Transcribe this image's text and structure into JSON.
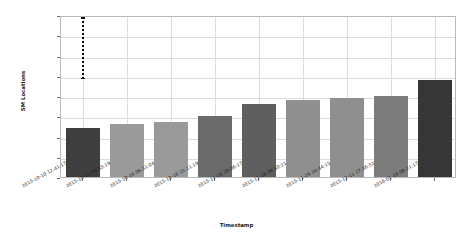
{
  "chart_data": {
    "type": "bar",
    "title": "",
    "xlabel": "Timestamp",
    "ylabel": "SM Locations",
    "ylim": [
      0,
      40
    ],
    "ytick_labels": [
      "0",
      "5",
      "10",
      "15",
      "20",
      "25",
      "30",
      "35",
      "40"
    ],
    "ytick_values": [
      0,
      5,
      10,
      15,
      20,
      25,
      30,
      35,
      40
    ],
    "grid": true,
    "legend": "none",
    "categories": [
      "2015-10-10 12:41:17",
      "2015-10-11 09:35:19",
      "2015-10-18 06:31:04",
      "2015-10-18 15:11:19",
      "2015-11-16 18:06:17",
      "2015-11-28 08:50:21",
      "2015-11-29 14:44:15",
      "2015-12-11 17:36:32",
      "2016-01-18 08:21:17"
    ],
    "values": [
      12,
      13,
      13.5,
      15,
      18,
      19,
      19.5,
      20,
      24
    ],
    "bar_colors": [
      "#3f3f3f",
      "#9a9a9a",
      "#9a9a9a",
      "#6b6b6b",
      "#5f5f5f",
      "#8f8f8f",
      "#8f8f8f",
      "#7c7c7c",
      "#363636"
    ],
    "annotations": [
      {
        "name": "error-bar",
        "category": "2015-10-10 12:41:17",
        "low": 25,
        "high": 40,
        "style": "dotted-vertical-line"
      }
    ]
  }
}
